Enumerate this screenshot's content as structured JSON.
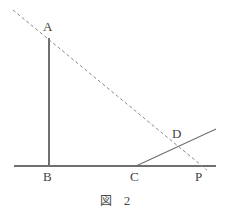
{
  "figure": {
    "caption_label": "図",
    "caption_number": "2",
    "stroke_color": "#6f6f6f",
    "dash_color": "#8a8a8a",
    "label_color": "#3f3f3f",
    "background": "#ffffff",
    "points": [
      {
        "id": "A",
        "label": "A",
        "x": 49,
        "y": 38,
        "label_x": 43,
        "label_y": 20
      },
      {
        "id": "B",
        "label": "B",
        "x": 49,
        "y": 166,
        "label_x": 43,
        "label_y": 170
      },
      {
        "id": "C",
        "label": "C",
        "x": 136,
        "y": 166,
        "label_x": 130,
        "label_y": 170
      },
      {
        "id": "D",
        "label": "D",
        "x": 178,
        "y": 145,
        "label_x": 172,
        "label_y": 127
      },
      {
        "id": "P",
        "label": "P",
        "x": 201,
        "y": 166,
        "label_x": 195,
        "label_y": 170
      }
    ],
    "segments": [
      {
        "name": "baseline-BP",
        "kind": "solid",
        "x1": 14,
        "y1": 166,
        "x2": 216,
        "y2": 166
      },
      {
        "name": "segment-AB",
        "kind": "solid",
        "x1": 49,
        "y1": 38,
        "x2": 49,
        "y2": 166
      },
      {
        "name": "ray-CD",
        "kind": "solid",
        "x1": 136,
        "y1": 166,
        "x2": 216,
        "y2": 129
      },
      {
        "name": "dashed-AP",
        "kind": "dashed",
        "x1": 13,
        "y1": 10,
        "x2": 207,
        "y2": 170
      }
    ]
  }
}
